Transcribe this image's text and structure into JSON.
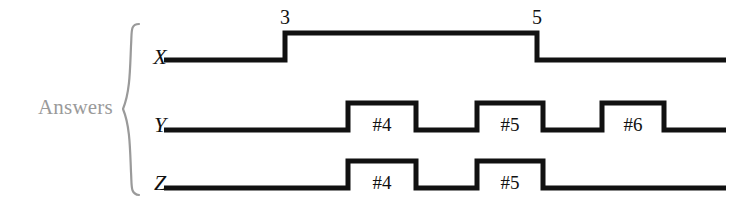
{
  "figure": {
    "group_label": "Answers",
    "brace_icon": "curly-brace-icon",
    "colors": {
      "waveform": "#111111",
      "group_label": "#9a9a9a",
      "background": "#ffffff"
    }
  },
  "chart_data": {
    "type": "line",
    "title": "",
    "subtitle": "",
    "xlabel": "",
    "ylabel": "",
    "grid": false,
    "legend": "none",
    "signals": [
      {
        "name": "X",
        "label": "X",
        "baseline_y": 60,
        "high_y": 33,
        "start_x": 164,
        "end_x": 726,
        "transitions": [
          {
            "x": 285,
            "to": "high",
            "mark": "3"
          },
          {
            "x": 537,
            "to": "low",
            "mark": "5"
          }
        ],
        "pulses": [
          {
            "start_x": 285,
            "end_x": 537,
            "tag": ""
          }
        ],
        "edge_marks": [
          {
            "text": "3",
            "x": 285,
            "y": 8
          },
          {
            "text": "5",
            "x": 537,
            "y": 8
          }
        ]
      },
      {
        "name": "Y",
        "label": "Y",
        "baseline_y": 130,
        "high_y": 103,
        "start_x": 164,
        "end_x": 726,
        "pulses": [
          {
            "start_x": 348,
            "end_x": 416,
            "tag": "#4"
          },
          {
            "start_x": 477,
            "end_x": 543,
            "tag": "#5"
          },
          {
            "start_x": 602,
            "end_x": 664,
            "tag": "#6"
          }
        ],
        "edge_marks": []
      },
      {
        "name": "Z",
        "label": "Z",
        "baseline_y": 188,
        "high_y": 161,
        "start_x": 164,
        "end_x": 726,
        "pulses": [
          {
            "start_x": 348,
            "end_x": 416,
            "tag": "#4"
          },
          {
            "start_x": 477,
            "end_x": 543,
            "tag": "#5"
          }
        ],
        "edge_marks": []
      }
    ],
    "annotations": [
      {
        "text": "3",
        "signal": "X",
        "kind": "rising-edge-time"
      },
      {
        "text": "5",
        "signal": "X",
        "kind": "falling-edge-time"
      },
      {
        "text": "#4",
        "signal": "Y",
        "kind": "pulse-tag"
      },
      {
        "text": "#5",
        "signal": "Y",
        "kind": "pulse-tag"
      },
      {
        "text": "#6",
        "signal": "Y",
        "kind": "pulse-tag"
      },
      {
        "text": "#4",
        "signal": "Z",
        "kind": "pulse-tag"
      },
      {
        "text": "#5",
        "signal": "Z",
        "kind": "pulse-tag"
      }
    ]
  }
}
